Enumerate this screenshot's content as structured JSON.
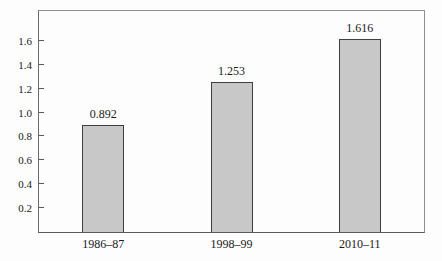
{
  "chart_data": {
    "type": "bar",
    "categories": [
      "1986–87",
      "1998–99",
      "2010–11"
    ],
    "values": [
      0.892,
      1.253,
      1.616
    ],
    "value_labels": [
      "0.892",
      "1.253",
      "1.616"
    ],
    "y_ticks": [
      0.2,
      0.4,
      0.6,
      0.8,
      1.0,
      1.2,
      1.4,
      1.6
    ],
    "y_tick_labels": [
      "0.2",
      "0.4",
      "0.6",
      "0.8",
      "1.0",
      "1.2",
      "1.4",
      "1.6"
    ],
    "ylim": [
      0,
      1.85
    ],
    "title": "",
    "xlabel": "",
    "ylabel": "",
    "legend_position": "none",
    "grid": false,
    "colors": {
      "bar_fill": "#c8c8c8",
      "bar_border": "#3f3f3f",
      "frame": "#8f8f8f",
      "axis": "#5a5a5a",
      "text": "#1a1a1a",
      "background": "#fdfdfd"
    }
  }
}
